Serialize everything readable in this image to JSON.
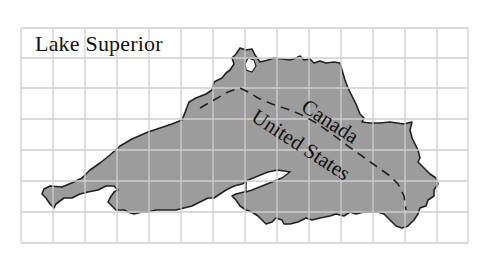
{
  "map": {
    "title": "Lake Superior",
    "labels": {
      "north": "Canada",
      "south": "United States"
    },
    "grid": {
      "columns": 14,
      "rows": 7
    },
    "colors": {
      "lake_fill": "#9c9c9c",
      "grid_line": "#cfcfcf",
      "outline": "#222222",
      "border": "#222222",
      "background": "#ffffff"
    },
    "legend": {
      "border_line_style": "dashed",
      "border_meaning": "international border"
    }
  }
}
